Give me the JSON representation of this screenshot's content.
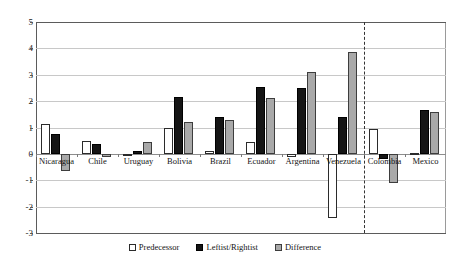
{
  "chart_data": {
    "type": "bar",
    "title": "",
    "subtitle": "",
    "xlabel": "",
    "ylabel": "",
    "ylim": [
      -3,
      5
    ],
    "yticks": [
      5,
      4,
      3,
      2,
      1,
      0,
      -1,
      -2,
      -3
    ],
    "ytick_labels": [
      "5",
      "4",
      "3",
      "2",
      "1",
      "0",
      "-1",
      "-2",
      "-3"
    ],
    "grid": true,
    "legend_position": "bottom",
    "categories": [
      "Nicaragua",
      "Chile",
      "Uruguay",
      "Bolivia",
      "Brazil",
      "Ecuador",
      "Argentina",
      "Venezuela",
      "Colombia",
      "Mexico"
    ],
    "series": [
      {
        "name": "Predecessor",
        "color": "#ffffff",
        "values": [
          1.15,
          0.5,
          -0.05,
          1.0,
          0.1,
          0.45,
          -0.12,
          -2.45,
          0.95,
          0.05
        ]
      },
      {
        "name": "Leftist/Rightist",
        "color": "#151515",
        "values": [
          0.75,
          0.38,
          0.12,
          2.15,
          1.4,
          2.55,
          2.5,
          1.4,
          -0.2,
          1.65
        ]
      },
      {
        "name": "Difference",
        "color": "#a9a9a9",
        "values": [
          -0.65,
          -0.1,
          0.45,
          1.2,
          1.3,
          2.1,
          3.1,
          3.85,
          -1.1,
          1.6
        ]
      }
    ],
    "annotations": [
      {
        "type": "vertical-dashed-divider",
        "after_category": "Venezuela",
        "label": ""
      }
    ]
  },
  "legend": {
    "items": [
      {
        "label": "Predecessor",
        "swatch": "predecessor"
      },
      {
        "label": "Leftist/Rightist",
        "swatch": "leftist"
      },
      {
        "label": "Difference",
        "swatch": "difference"
      }
    ]
  }
}
